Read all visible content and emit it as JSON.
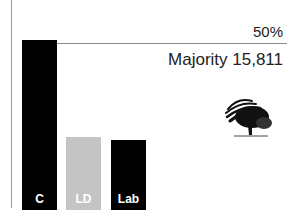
{
  "chart_data": {
    "type": "bar",
    "title": "",
    "categories": [
      "C",
      "LD",
      "Lab"
    ],
    "values": [
      51,
      22,
      21
    ],
    "colors": [
      "#000000",
      "#c4c4c4",
      "#000000"
    ],
    "xlabel": "",
    "ylabel": "",
    "ylim": [
      0,
      50
    ],
    "reference_line": {
      "value": 50,
      "label": "50%"
    },
    "annotation": "Majority 15,811",
    "grid": false,
    "legend": "none"
  },
  "logo": {
    "name": "conservative-tree-logo"
  }
}
